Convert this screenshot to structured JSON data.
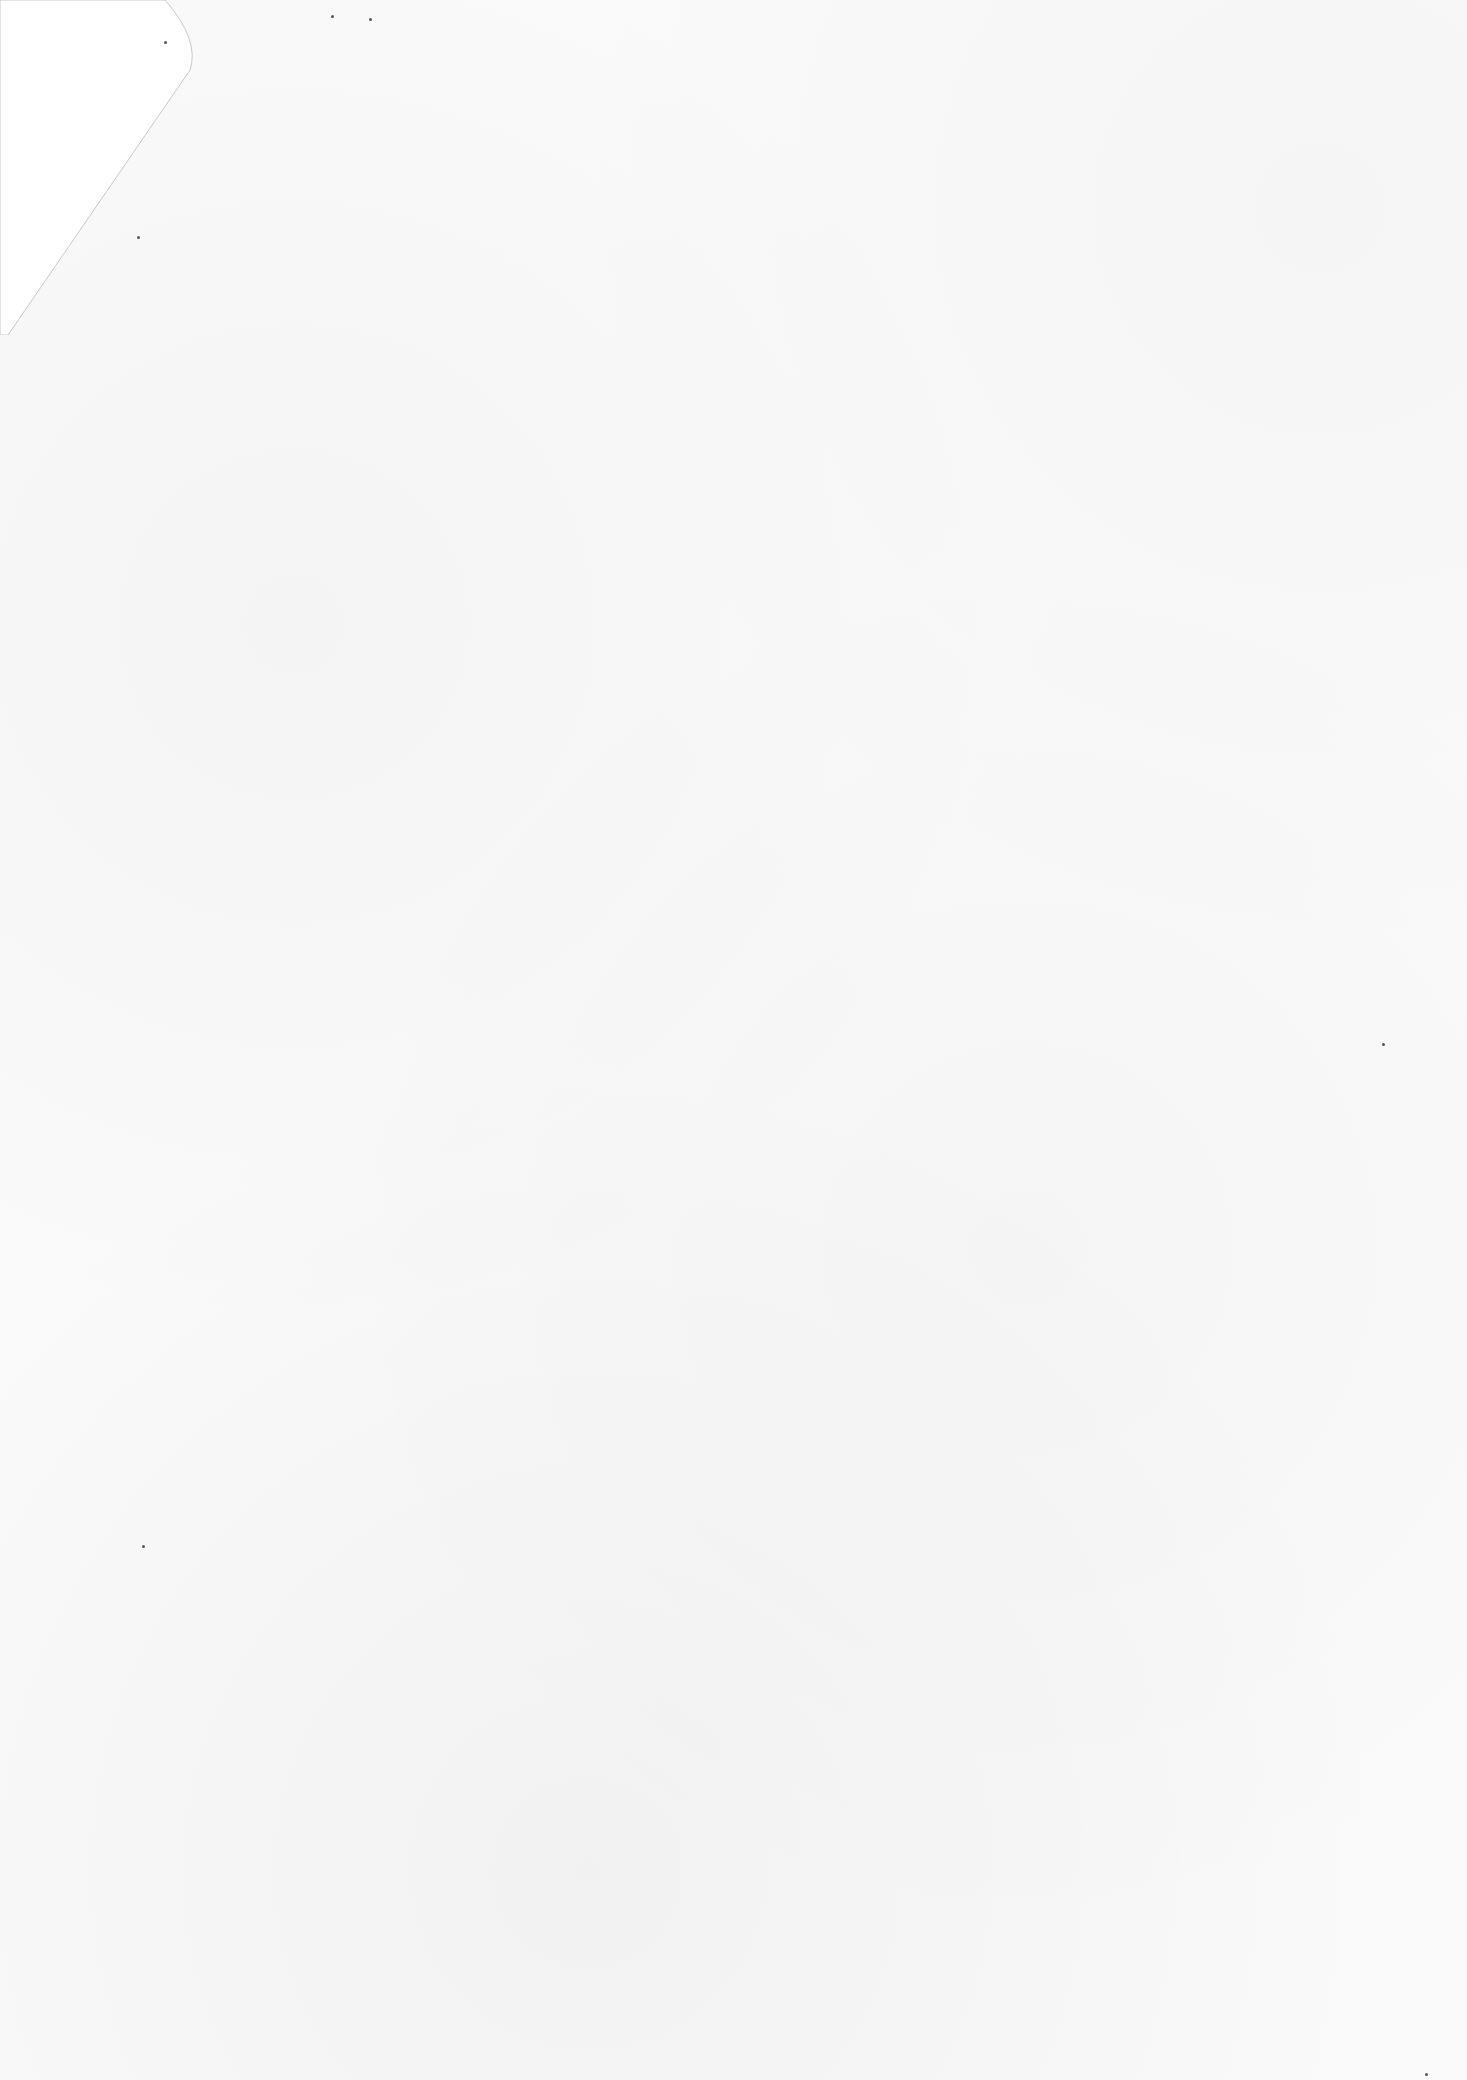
{
  "document": {
    "type": "blank-scanned-page",
    "text_content": "",
    "features": [
      "folded-top-left-corner",
      "paper-texture",
      "scan-specks"
    ]
  },
  "colors": {
    "paper": "#fafafa",
    "fold": "#ffffff",
    "fold_edge": "#c8c8c8",
    "speck": "#555555"
  }
}
